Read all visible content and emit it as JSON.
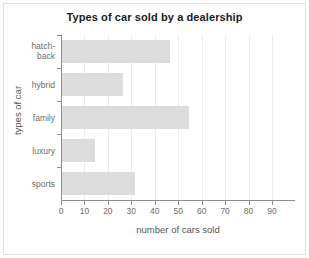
{
  "chart_data": {
    "type": "bar",
    "orientation": "horizontal",
    "title": "Types of car sold by a dealership",
    "xlabel": "number of cars sold",
    "ylabel": "types of car",
    "categories": [
      "hatch-\nback",
      "hybrid",
      "family",
      "luxury",
      "sports"
    ],
    "values": [
      46,
      26,
      54,
      14,
      31
    ],
    "xlim": [
      0,
      100
    ],
    "ylim": [
      0,
      5
    ],
    "xticks": [
      0,
      10,
      20,
      30,
      40,
      50,
      60,
      70,
      80,
      90
    ],
    "xticklabels": [
      "0",
      "10",
      "20",
      "30",
      "40",
      "50",
      "60",
      "70",
      "80",
      "90"
    ],
    "grid": "vertical",
    "legend": "none",
    "bar_color": "#dcdcdc",
    "gridline_color": "#ececed",
    "axis_color": "#8d8d8d",
    "tick_text_color": "#6e6e6e",
    "axis_label_color": "#555555",
    "title_color": "#1b1b1b",
    "background_color": "#ffffff",
    "frame_color": "#e2e2e2"
  }
}
